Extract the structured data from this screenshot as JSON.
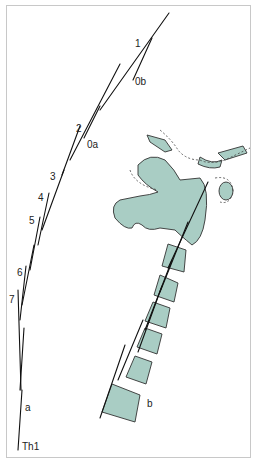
{
  "figure": {
    "colors": {
      "bone_fill": "#a9cdc4",
      "outline": "#333333",
      "line": "#111111",
      "frame": "#c8c8c8"
    }
  },
  "labels": {
    "l1": "1",
    "l0b": "0b",
    "l2": "2",
    "l0a": "0a",
    "l3": "3",
    "l4": "4",
    "l5": "5",
    "l6": "6",
    "l7": "7",
    "a": "a",
    "th1": "Th1",
    "b": "b"
  }
}
